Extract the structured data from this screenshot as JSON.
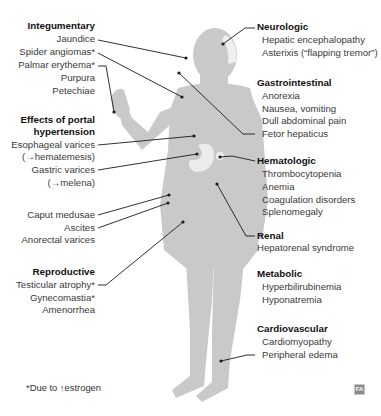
{
  "diagram": {
    "figure": "human-body-silhouette",
    "colors": {
      "body": "#c9c9c9",
      "body_shade": "#b9b9b9",
      "organ": "#ececec",
      "leader": "#1a1a1a",
      "heading": "#111111",
      "text": "#3a3a3a"
    },
    "left_groups": [
      {
        "heading": "Integumentary",
        "items": [
          "Jaundice",
          "Spider angiomas*",
          "Palmar erythema*",
          "Purpura",
          "Petechiae"
        ]
      },
      {
        "heading_lines": [
          "Effects of portal",
          "hypertension"
        ],
        "items": [
          "Esophageal varices",
          "(→hematemesis)",
          "Gastric varices",
          "(→melena)"
        ]
      },
      {
        "heading": "",
        "items": [
          "Caput medusae",
          "Ascites",
          "Anorectal varices"
        ]
      },
      {
        "heading": "Reproductive",
        "items": [
          "Testicular atrophy*",
          "Gynecomastia*",
          "Amenorrhea"
        ]
      }
    ],
    "right_groups": [
      {
        "heading": "Neurologic",
        "items": [
          "Hepatic encephalopathy",
          "Asterixis (“flapping tremor”)"
        ]
      },
      {
        "heading": "Gastrointestinal",
        "items": [
          "Anorexia",
          "Nausea, vomiting",
          "Dull abdominal pain",
          "Fetor hepaticus"
        ]
      },
      {
        "heading": "Hematologic",
        "items": [
          "Thrombocytopenia",
          "Anemia",
          "Coagulation disorders",
          "Splenomegaly"
        ]
      },
      {
        "heading": "Renal",
        "items": [
          "Hepatorenal syndrome"
        ]
      },
      {
        "heading": "Metabolic",
        "items": [
          "Hyperbilirubinemia",
          "Hyponatremia"
        ]
      },
      {
        "heading": "Cardiovascular",
        "items": [
          "Cardiomyopathy",
          "Peripheral edema"
        ]
      }
    ],
    "footnote": "*Due to ↑estrogen",
    "logo_text": "FA"
  }
}
